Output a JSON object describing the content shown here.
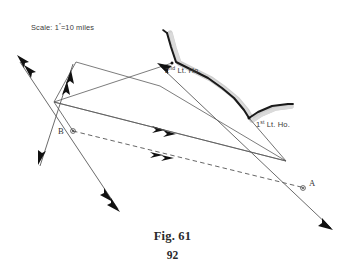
{
  "figure": {
    "caption": "Fig. 61",
    "page_number": "92",
    "scale_note": "Scale: 1″=10 miles",
    "scale_prefix": "Scale: 1",
    "scale_suffix": "=10 miles",
    "scale_sup": "″"
  },
  "labels": {
    "point_a": "A",
    "point_b": "B",
    "lighthouse_1_prefix": "1",
    "lighthouse_1_sup": "st",
    "lighthouse_1_suffix": " Lt. Ho.",
    "lighthouse_1_full": "1st Lt. Ho.",
    "lighthouse_2_prefix": "2",
    "lighthouse_2_sup": "nd",
    "lighthouse_2_suffix": " Lt. Ho.",
    "lighthouse_2_full": "2nd Lt. Ho."
  },
  "colors": {
    "ink": "#3a3a3a",
    "line": "#555555",
    "coast_dark": "#1a1a1a",
    "coast_shade": "#c9c9c9",
    "arrow": "#111111",
    "caption": "#2b2b2b",
    "background": "#ffffff"
  },
  "geometry": {
    "point_a": [
      305,
      188
    ],
    "point_b": [
      73,
      131
    ],
    "lighthouse_1": [
      250,
      118
    ],
    "lighthouse_2": [
      172,
      63
    ],
    "convergence_right": [
      286,
      161
    ],
    "vertex_top_left": [
      54,
      102
    ],
    "vertex_peak": [
      76,
      62
    ],
    "coast_path": "M 167,33 L 171,47 L 176,62 L 192,70 L 208,78 L 222,88 L 234,98 L 244,110 L 249,118 L 258,112 L 272,106 L 288,104",
    "lines": [
      {
        "name": "bearing-b-to-lighthouse2",
        "from": [
          14,
          57
        ],
        "to": [
          119,
          212
        ]
      },
      {
        "name": "bearing-b-to-lighthouse1",
        "from": [
          44,
          200
        ],
        "to": [
          130,
          68
        ]
      },
      {
        "name": "sight-line-top",
        "from": [
          54,
          102
        ],
        "to": [
          286,
          161
        ]
      },
      {
        "name": "sight-line-mid",
        "from": [
          54,
          102
        ],
        "to": [
          286,
          161
        ]
      },
      {
        "name": "dashed-baseline-ab",
        "from": [
          73,
          131
        ],
        "to": [
          305,
          188
        ]
      }
    ]
  },
  "elements": {
    "coastline_name": "coastline",
    "dashed_line_name": "baseline-a-to-b"
  }
}
